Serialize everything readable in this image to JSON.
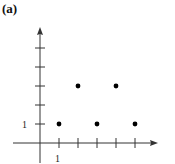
{
  "panel": {
    "label": "(a)"
  },
  "axes": {
    "y_tick_label": "1",
    "x_tick_label": "1",
    "colors": {
      "axis": "#333333",
      "point": "#000000"
    }
  },
  "chart_data": {
    "type": "scatter",
    "title": "(a)",
    "xlabel": "",
    "ylabel": "",
    "x": [
      1,
      2,
      3,
      4,
      5
    ],
    "y": [
      1,
      3,
      1,
      3,
      1
    ],
    "x_ticks": [
      1,
      2,
      3,
      4,
      5
    ],
    "y_ticks": [
      1,
      2,
      3,
      4,
      5
    ],
    "tick_labels": {
      "x": [
        "1"
      ],
      "y": [
        "1"
      ]
    },
    "xlim": [
      -1,
      6
    ],
    "ylim": [
      -1,
      6.5
    ],
    "grid": false,
    "legend": null
  }
}
